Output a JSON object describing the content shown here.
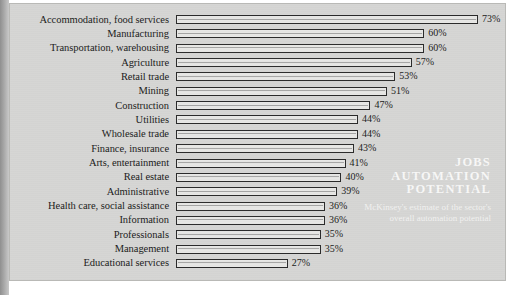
{
  "chart_data": {
    "type": "bar",
    "orientation": "horizontal",
    "title": "JOBS AUTOMATION POTENTIAL",
    "subtitle": "McKinsey's estimate of the sector's overall automation potential",
    "xlabel": "",
    "ylabel": "",
    "xlim": [
      0,
      73
    ],
    "grid": false,
    "legend": null,
    "value_suffix": "%",
    "categories": [
      "Accommodation, food services",
      "Manufacturing",
      "Transportation, warehousing",
      "Agriculture",
      "Retail trade",
      "Mining",
      "Construction",
      "Utilities",
      "Wholesale trade",
      "Finance, insurance",
      "Arts, entertainment",
      "Real estate",
      "Administrative",
      "Health care, social assistance",
      "Information",
      "Professionals",
      "Management",
      "Educational services"
    ],
    "values": [
      73,
      60,
      60,
      57,
      53,
      51,
      47,
      44,
      44,
      43,
      41,
      40,
      39,
      36,
      36,
      35,
      35,
      27
    ],
    "value_labels": [
      "73%",
      "60%",
      "60%",
      "57%",
      "53%",
      "51%",
      "47%",
      "44%",
      "44%",
      "43%",
      "41%",
      "40%",
      "39%",
      "36%",
      "36%",
      "35%",
      "35%",
      "27%"
    ]
  },
  "colors": {
    "panel_background": "#d6d6d4",
    "bar_fill": "#e7e7e5",
    "bar_border": "#2a2a2a",
    "text": "#1b1b1b",
    "watermark_text": "#ffffff"
  }
}
